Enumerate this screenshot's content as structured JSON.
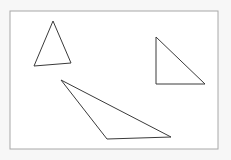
{
  "figure": {
    "title": "Geometric figure: three triangles on a bordered white panel",
    "width": 231,
    "height": 160,
    "background_color": "#f7f7f7",
    "panel": {
      "name": "bordered-panel",
      "fill_color": "#ffffff",
      "border_color": "#a8a8a8",
      "border_width": 1,
      "x": 10,
      "y": 11,
      "width": 208,
      "height": 138
    },
    "shape_style": {
      "stroke_color": "#3a3a3a",
      "stroke_width": 1,
      "fill": "none"
    },
    "shapes": [
      {
        "id": "triangle-1",
        "label": "acute triangle upper left",
        "kind": "triangle",
        "points": "53,21 34,66 71,63",
        "vertices": [
          [
            53,
            21
          ],
          [
            34,
            66
          ],
          [
            71,
            63
          ]
        ]
      },
      {
        "id": "triangle-2",
        "label": "right triangle upper right",
        "kind": "triangle",
        "points": "156,37 156,84 205,84",
        "vertices": [
          [
            156,
            37
          ],
          [
            156,
            84
          ],
          [
            205,
            84
          ]
        ]
      },
      {
        "id": "triangle-3",
        "label": "obtuse thin triangle lower center",
        "kind": "triangle",
        "points": "61,80 107,139 171,137",
        "vertices": [
          [
            61,
            80
          ],
          [
            107,
            139
          ],
          [
            171,
            137
          ]
        ]
      }
    ],
    "shape_count": 3
  }
}
